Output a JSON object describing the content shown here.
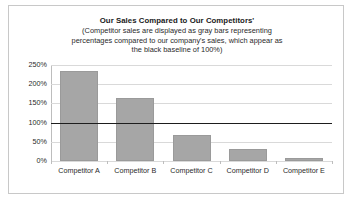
{
  "chart_data": {
    "type": "bar",
    "title": "Our Sales Compared to Our Competitors'",
    "subtitle_lines": [
      "(Competitor sales are displayed as gray bars representing",
      "percentages compared to our company's sales, which appear as",
      "the black baseline of 100%)"
    ],
    "categories": [
      "Competitor A",
      "Competitor B",
      "Competitor C",
      "Competitor D",
      "Competitor E"
    ],
    "values": [
      235,
      163,
      68,
      30,
      8
    ],
    "value_unit": "%",
    "baseline": 100,
    "baseline_label": "100%",
    "xlabel": "",
    "ylabel": "",
    "ylim": [
      0,
      250
    ],
    "ytick_values": [
      0,
      50,
      100,
      150,
      200,
      250
    ],
    "ytick_labels": [
      "0%",
      "50%",
      "100%",
      "150%",
      "200%",
      "250%"
    ],
    "grid": true,
    "legend": false,
    "colors": {
      "bar_fill": "#a6a6a6",
      "bar_border": "#9a9a9a",
      "baseline_line": "#1d1d1d",
      "gridline": "#d9d9d9",
      "axis": "#bdbdbd",
      "text": "#2a2a2a",
      "frame_border": "#c8c8c8",
      "background": "#ffffff"
    }
  }
}
